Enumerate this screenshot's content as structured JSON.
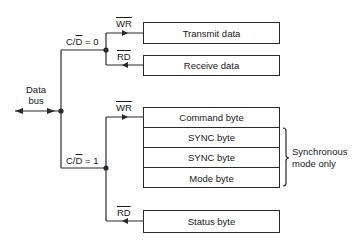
{
  "data_bus": {
    "line1": "Data",
    "line2": "bus"
  },
  "upper_branch": {
    "condition_prefix": "C/",
    "condition_overlined": "D",
    "condition_suffix": " = 0",
    "write_signal": "WR",
    "read_signal": "RD",
    "targets": [
      {
        "label": "Transmit data",
        "direction": "write"
      },
      {
        "label": "Receive data",
        "direction": "read"
      }
    ]
  },
  "lower_branch": {
    "condition_prefix": "C/",
    "condition_overlined": "D",
    "condition_suffix": " = 1",
    "write_signal": "WR",
    "read_signal": "RD",
    "write_registers": [
      {
        "label": "Command byte"
      },
      {
        "label": "SYNC byte"
      },
      {
        "label": "SYNC byte"
      },
      {
        "label": "Mode byte"
      }
    ],
    "read_registers": [
      {
        "label": "Status byte"
      }
    ]
  },
  "annotation": {
    "line1": "Synchronous",
    "line2": "mode only"
  }
}
